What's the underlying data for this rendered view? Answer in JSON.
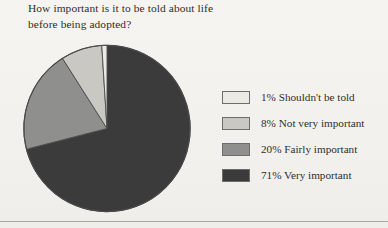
{
  "page": {
    "background_color": "#f3f2ee",
    "rule_color": "#a9a8a4"
  },
  "title": {
    "line1": "How important is it to be told about life",
    "line2": "before being adopted?"
  },
  "chart_data": {
    "type": "pie",
    "title": "How important is it to be told about life before being adopted?",
    "xlabel": "",
    "ylabel": "",
    "legend_position": "right",
    "grid": false,
    "start_angle_deg": 0,
    "direction": "clockwise",
    "categories": [
      "Shouldn't be told",
      "Not very important",
      "Fairly important",
      "Very important"
    ],
    "values": [
      1,
      8,
      20,
      71
    ],
    "value_unit": "%",
    "colors": [
      "#eceae5",
      "#c9c8c3",
      "#8f8f8d",
      "#3b3b3b"
    ],
    "slices": [
      {
        "label": "Shouldn't be told",
        "value": 1,
        "display": "1% Shouldn't be told",
        "color": "#eceae5"
      },
      {
        "label": "Not very important",
        "value": 8,
        "display": "8% Not very important",
        "color": "#c9c8c3"
      },
      {
        "label": "Fairly important",
        "value": 20,
        "display": "20% Fairly important",
        "color": "#8f8f8d"
      },
      {
        "label": "Very important",
        "value": 71,
        "display": "71% Very important",
        "color": "#3b3b3b"
      }
    ]
  },
  "legend": {
    "items": [
      {
        "text": "1% Shouldn't be told",
        "color": "#eceae5"
      },
      {
        "text": "8% Not very important",
        "color": "#c9c8c3"
      },
      {
        "text": "20% Fairly important",
        "color": "#8f8f8d"
      },
      {
        "text": "71% Very important",
        "color": "#3b3b3b"
      }
    ]
  }
}
